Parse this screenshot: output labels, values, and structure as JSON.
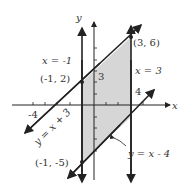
{
  "figure": {
    "axes": {
      "x_label": "x",
      "y_label": "y"
    },
    "ticks": {
      "x_label": "-4",
      "y_label": "3",
      "x_right_label": "4"
    },
    "lines": {
      "vertical_left": "x = -1",
      "vertical_right": "x = 3",
      "diagonal_upper": "y = x + 3",
      "diagonal_lower": "y = x - 4"
    },
    "points": {
      "top_right": "(3, 6)",
      "top_left": "(-1, 2)",
      "bottom_left": "(-1, -5)"
    },
    "colors": {
      "shade": "#d6d6d6",
      "ink": "#222222"
    }
  }
}
